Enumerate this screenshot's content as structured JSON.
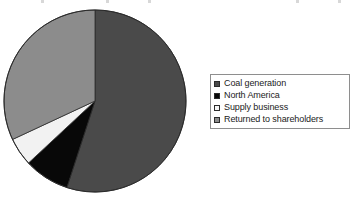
{
  "chart_data": {
    "type": "pie",
    "title": "",
    "subtitle": "",
    "xlabel": "",
    "ylabel": "",
    "grid": false,
    "legend_position": "right",
    "start_angle_deg": 0,
    "direction": "clockwise",
    "categories": [
      "Coal generation",
      "North America",
      "Supply business",
      "Returned to shareholders"
    ],
    "values": [
      55,
      8,
      5,
      32
    ],
    "units": "percent",
    "slices": [
      {
        "label": "Coal generation",
        "value": 55,
        "color": "#4a4a4a",
        "start_angle_deg": 0,
        "end_angle_deg": 198
      },
      {
        "label": "North America",
        "value": 8,
        "color": "#080808",
        "start_angle_deg": 198,
        "end_angle_deg": 227
      },
      {
        "label": "Supply business",
        "value": 5,
        "color": "#f2f2f2",
        "start_angle_deg": 227,
        "end_angle_deg": 245
      },
      {
        "label": "Returned to shareholders",
        "value": 32,
        "color": "#8c8c8c",
        "start_angle_deg": 245,
        "end_angle_deg": 360
      }
    ]
  },
  "legend": {
    "items": [
      {
        "label": "Coal generation",
        "color": "#4a4a4a"
      },
      {
        "label": "North America",
        "color": "#080808"
      },
      {
        "label": "Supply business",
        "color": "#f6f6f6"
      },
      {
        "label": "Returned to shareholders",
        "color": "#8c8c8c"
      }
    ]
  },
  "colors": {
    "background": "#ffffff",
    "outline": "#2b2b2b",
    "legend_border": "#8e8e8e",
    "text": "#1b1b1b"
  }
}
